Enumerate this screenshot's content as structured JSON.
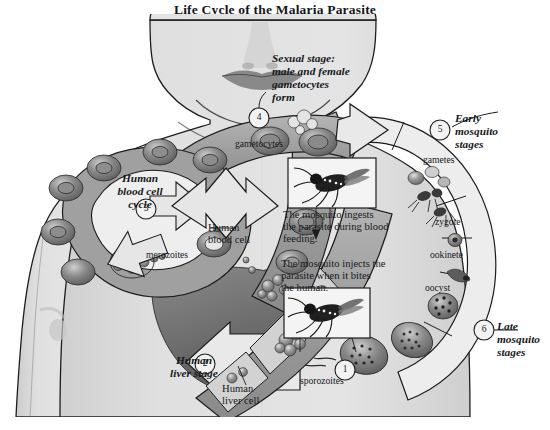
{
  "figure": {
    "title": "Life Cycle of the Malaria Parasite",
    "domain": "biology-diagram"
  },
  "stages": [
    {
      "number": "1",
      "heading": "",
      "label": "sporozoites"
    },
    {
      "number": "2",
      "heading": "Human\nliver stage",
      "heading_line1": "Human",
      "heading_line2": "liver stage",
      "label": "Human\nliver cell",
      "label_line1": "Human",
      "label_line2": "liver cell"
    },
    {
      "number": "3",
      "heading_line1": "Human",
      "heading_line2": "blood cell",
      "heading_line3": "cycle",
      "label": "merozoites",
      "label2_line1": "Human",
      "label2_line2": "blood cell"
    },
    {
      "number": "4",
      "heading_line1": "Sexual stage:",
      "heading_line2": "male and female",
      "heading_line3": "gametocytes",
      "heading_line4": "form",
      "label": "gametocytes"
    },
    {
      "number": "5",
      "heading_line1": "Early",
      "heading_line2": "mosquito",
      "heading_line3": "stages",
      "sub_labels": [
        "gametes",
        "zygote",
        "ookinete"
      ]
    },
    {
      "number": "6",
      "heading_line1": "Late",
      "heading_line2": "mosquito",
      "heading_line3": "stages",
      "sub_labels": [
        "oocyst"
      ]
    }
  ],
  "callouts": [
    {
      "id": "ingest",
      "line1": "The mosquito ingests",
      "line2": "the parasite during blood",
      "line3": "feeding.",
      "photo": "mosquito-photo"
    },
    {
      "id": "inject",
      "line1": "The mosquito injects the",
      "line2": "parasite when it bites",
      "line3": "the human.",
      "photo": "mosquito-photo"
    }
  ],
  "colors": {
    "skin": "#d9d9d9",
    "skin_light": "#e3e3e3",
    "outline": "#1c1c1c",
    "band_dark": "#8f8f8f",
    "band_mid": "#a8a8a8",
    "band_light": "#ededed",
    "liver": "#6f6f6f",
    "cell_dark": "#707070",
    "text": "#16181c"
  }
}
